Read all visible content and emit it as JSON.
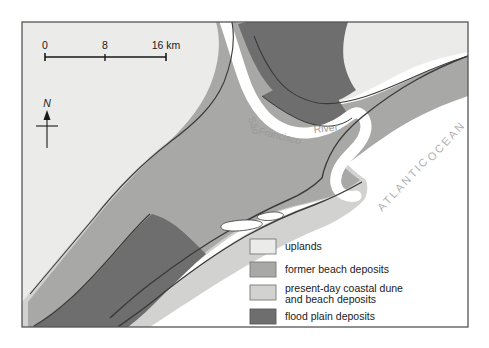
{
  "figure": {
    "kind": "geological-coastal-map",
    "region": "São Francisco River mouth, Brazil",
    "frame": {
      "x": 22,
      "y": 22,
      "width": 446,
      "height": 305
    }
  },
  "map": {
    "labels": {
      "river": "São Francisco  River",
      "river_parts": [
        "São",
        "Francisco",
        "River"
      ],
      "ocean": "ATLANTIC OCEAN",
      "ocean_parts": [
        "ATLANTIC",
        "OCEAN"
      ]
    },
    "north_arrow": {
      "label": "N"
    },
    "scale_bar": {
      "unit": "km",
      "ticks": [
        "0",
        "8",
        "16 km"
      ],
      "values": [
        0,
        8,
        16
      ],
      "max_km": 16
    }
  },
  "legend": {
    "items": [
      {
        "label": "uplands",
        "color": "#ebebe9",
        "key": "uplands"
      },
      {
        "label": "former beach deposits",
        "color": "#a8a8a6",
        "key": "former-beach-deposits"
      },
      {
        "label": "present-day coastal dune",
        "label2": "and beach deposits",
        "color": "#d2d2d0",
        "key": "present-day-coastal-dune-and-beach-deposits"
      },
      {
        "label": "flood plain deposits",
        "color": "#6e6e6e",
        "key": "flood-plain-deposits"
      }
    ]
  },
  "colors": {
    "uplands": "#ebebe9",
    "former_beach": "#a8a8a6",
    "present_dune_beach": "#d2d2d0",
    "flood_plain": "#6e6e6e",
    "ocean": "#ffffff",
    "river": "#ffffff",
    "outline": "#3a3a3a",
    "frame": "#555555",
    "text": "#1a1a1a",
    "label_muted": "#9a9a98",
    "page_background": "#ffffff"
  }
}
